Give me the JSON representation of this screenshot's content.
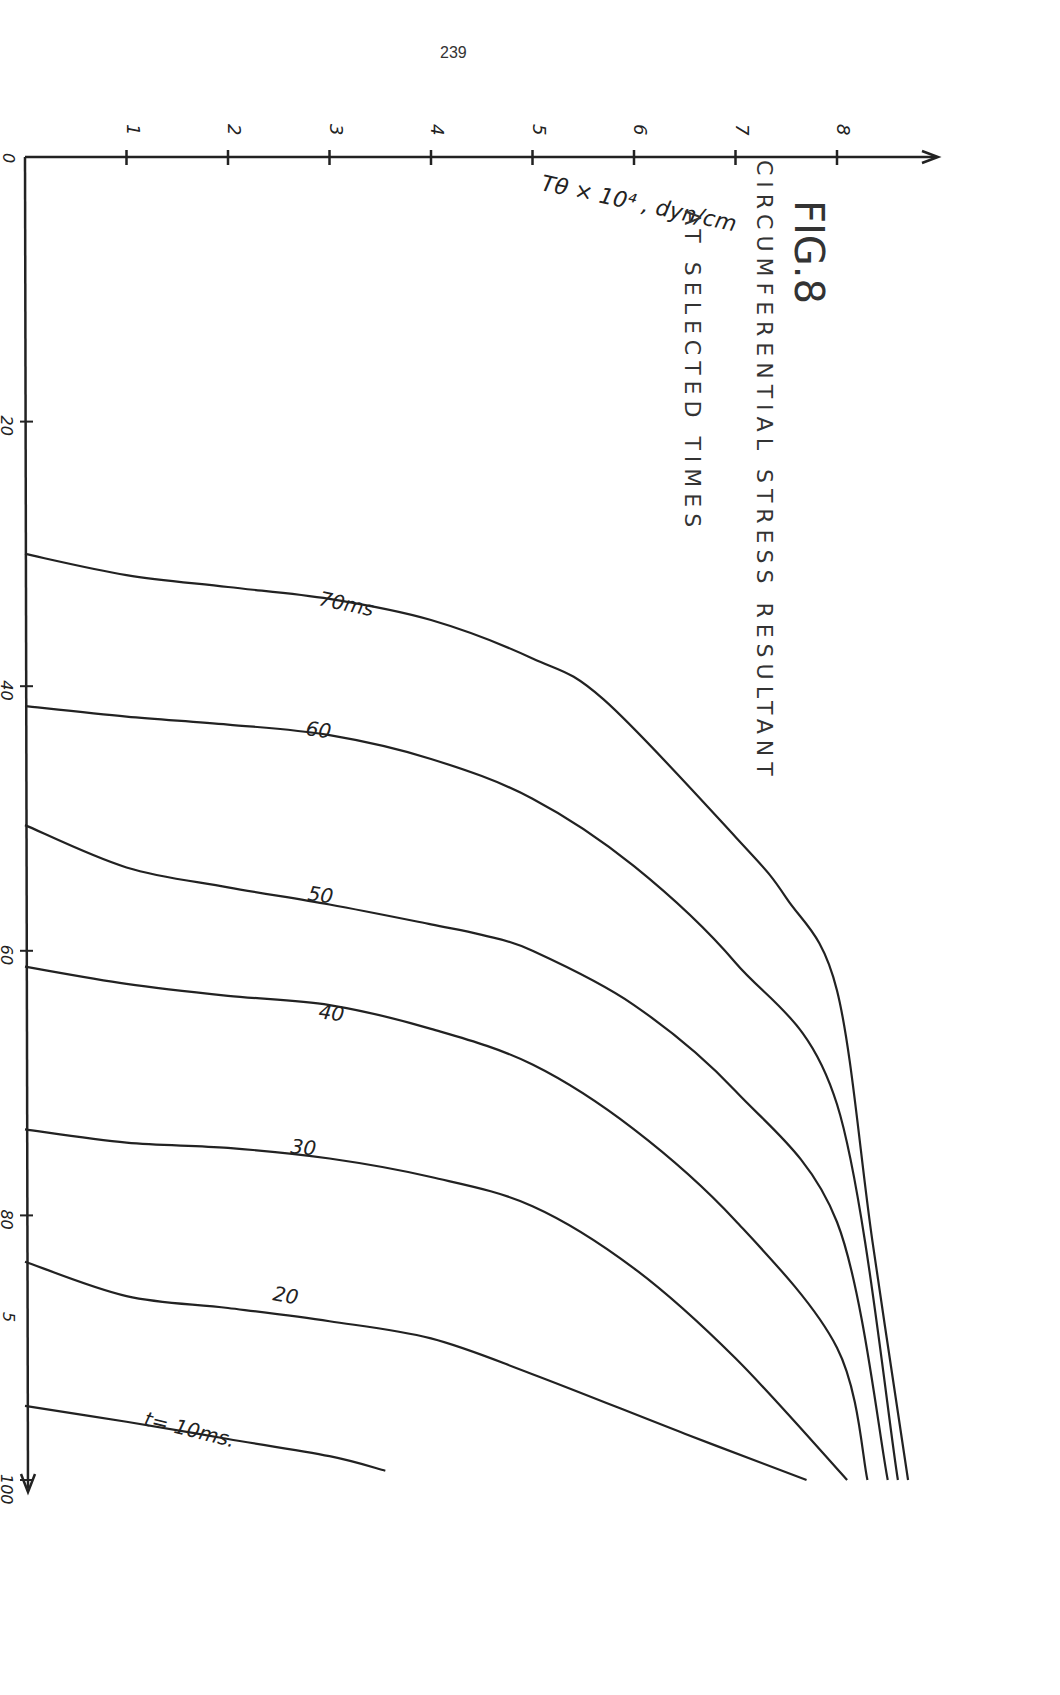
{
  "page": {
    "number": "239"
  },
  "figure": {
    "label": "FIG.8",
    "title_line1": "CIRCUMFERENTIAL  STRESS  RESULTANT",
    "title_line2": "AT  SELECTED  TIMES"
  },
  "axes": {
    "stress_axis_label": "Tθ × 10⁴ , dyn/cm",
    "stress_ticks": [
      "1",
      "2",
      "3",
      "4",
      "5",
      "6",
      "7",
      "8"
    ],
    "position_origin_label": "0",
    "position_ticks": [
      "20",
      "40",
      "60",
      "80",
      "100"
    ],
    "position_extra_label": "5"
  },
  "curve_labels": [
    "70ms",
    "60",
    "50",
    "40",
    "30",
    "20",
    "t= 10ms."
  ],
  "chart_data": {
    "type": "line",
    "title": "FIG.8 CIRCUMFERENTIAL STRESS RESULTANT AT SELECTED TIMES",
    "orientation": "rotated 90° — stress axis runs horizontally across top, position axis runs vertically downward",
    "xlabel": "Tθ × 10⁴, dyn/cm",
    "ylabel": "",
    "stress_range": [
      0,
      9
    ],
    "position_range": [
      0,
      100
    ],
    "stress_ticks": [
      1,
      2,
      3,
      4,
      5,
      6,
      7,
      8
    ],
    "position_ticks": [
      0,
      20,
      40,
      60,
      80,
      100
    ],
    "grid": false,
    "legend": "inline curve labels",
    "series": [
      {
        "name": "t=10ms",
        "points": [
          [
            0,
            94.4
          ],
          [
            1,
            95.6
          ],
          [
            2,
            96.9
          ],
          [
            3,
            98.2
          ],
          [
            3.55,
            99.3
          ]
        ]
      },
      {
        "name": "20",
        "points": [
          [
            0,
            83.5
          ],
          [
            1,
            86.1
          ],
          [
            2,
            87.0
          ],
          [
            3,
            88.0
          ],
          [
            4,
            89.3
          ],
          [
            5,
            92.0
          ],
          [
            6.5,
            96.5
          ],
          [
            7.7,
            100
          ]
        ]
      },
      {
        "name": "30",
        "points": [
          [
            0,
            73.5
          ],
          [
            1,
            74.5
          ],
          [
            2,
            74.9
          ],
          [
            3,
            75.7
          ],
          [
            4,
            77.1
          ],
          [
            5,
            79.3
          ],
          [
            6,
            84.0
          ],
          [
            7,
            90.8
          ],
          [
            8.1,
            100
          ]
        ]
      },
      {
        "name": "40",
        "points": [
          [
            0,
            61.2
          ],
          [
            1,
            62.5
          ],
          [
            2,
            63.4
          ],
          [
            3,
            64.1
          ],
          [
            4,
            65.9
          ],
          [
            5,
            68.6
          ],
          [
            6,
            73.5
          ],
          [
            7,
            80.4
          ],
          [
            8,
            90.0
          ],
          [
            8.3,
            100
          ]
        ]
      },
      {
        "name": "50",
        "points": [
          [
            0,
            50.5
          ],
          [
            1,
            53.7
          ],
          [
            2,
            55.2
          ],
          [
            3,
            56.5
          ],
          [
            4,
            58.0
          ],
          [
            4.5,
            58.8
          ],
          [
            5,
            60.0
          ],
          [
            6,
            64.1
          ],
          [
            7,
            70.6
          ],
          [
            8,
            80.5
          ],
          [
            8.5,
            100
          ]
        ]
      },
      {
        "name": "60",
        "points": [
          [
            0,
            41.5
          ],
          [
            1,
            42.3
          ],
          [
            2,
            42.9
          ],
          [
            3,
            43.7
          ],
          [
            4,
            45.5
          ],
          [
            5,
            48.5
          ],
          [
            6,
            53.6
          ],
          [
            7,
            60.9
          ],
          [
            8,
            71.6
          ],
          [
            8.6,
            100
          ]
        ]
      },
      {
        "name": "70ms",
        "points": [
          [
            0,
            30.0
          ],
          [
            1,
            31.6
          ],
          [
            2,
            32.5
          ],
          [
            3,
            33.4
          ],
          [
            4,
            35.0
          ],
          [
            5,
            37.9
          ],
          [
            5.7,
            41.0
          ],
          [
            7,
            51.4
          ],
          [
            7.5,
            56.0
          ],
          [
            8,
            63.0
          ],
          [
            8.35,
            82.0
          ],
          [
            8.7,
            100
          ]
        ]
      }
    ]
  }
}
